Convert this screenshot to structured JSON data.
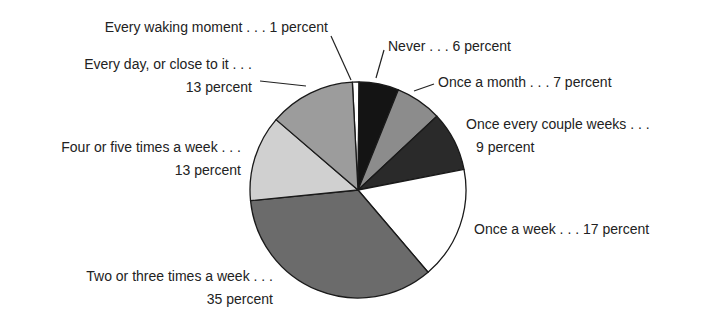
{
  "chart_data": {
    "type": "pie",
    "title": "",
    "start_angle_deg": -3,
    "direction": "clockwise",
    "center": [
      358,
      190
    ],
    "radius": 108,
    "slices": [
      {
        "label": "Every waking moment",
        "value": 1,
        "color": "#ffffff"
      },
      {
        "label": "Never",
        "value": 6,
        "color": "#141414"
      },
      {
        "label": "Once a month",
        "value": 7,
        "color": "#8c8c8c"
      },
      {
        "label": "Once every couple weeks",
        "value": 9,
        "color": "#2a2a2a"
      },
      {
        "label": "Once a week",
        "value": 17,
        "color": "#ffffff"
      },
      {
        "label": "Two or three times a week",
        "value": 35,
        "color": "#6b6b6b"
      },
      {
        "label": "Four or five times a week",
        "value": 13,
        "color": "#d0d0d0"
      },
      {
        "label": "Every day, or close to it",
        "value": 13,
        "color": "#9c9c9c"
      }
    ],
    "units": "percent"
  },
  "labels": {
    "every_waking": "Every waking moment . . . 1 percent",
    "every_day_line1": "Every day, or close to it . . .",
    "every_day_line2": "13 percent",
    "four_five_line1": "Four or five times a week . . .",
    "four_five_line2": "13 percent",
    "two_three_line1": "Two or three times a week . . .",
    "two_three_line2": "35 percent",
    "never": "Never . . . 6 percent",
    "once_month": "Once a month . . . 7 percent",
    "couple_weeks_line1": "Once every couple weeks . . .",
    "couple_weeks_line2": "9 percent",
    "once_week": "Once a week . . . 17 percent"
  },
  "leaders": [
    {
      "name": "leader-every-waking",
      "x1": 331,
      "y1": 36,
      "x2": 351,
      "y2": 80
    },
    {
      "name": "leader-never",
      "x1": 384,
      "y1": 50,
      "x2": 376,
      "y2": 78
    },
    {
      "name": "leader-once-month",
      "x1": 434,
      "y1": 84,
      "x2": 414,
      "y2": 91
    },
    {
      "name": "leader-every-day",
      "x1": 260,
      "y1": 81,
      "x2": 306,
      "y2": 86
    }
  ]
}
